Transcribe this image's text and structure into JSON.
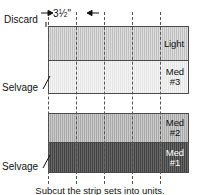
{
  "diagram": {
    "caption": "Subcut the strip sets into units.",
    "dimension": {
      "whole": "3",
      "numerator": "1",
      "denominator": "2",
      "unit": "\"",
      "full_label": "3 1/2\"",
      "arrow_left": "arrow-right-glyph",
      "arrow_right": "arrow-left-glyph"
    },
    "callouts": [
      {
        "id": "discard",
        "label": "Discard"
      },
      {
        "id": "selvage1",
        "label": "Selvage"
      },
      {
        "id": "selvage2",
        "label": "Selvage"
      }
    ],
    "groups": [
      {
        "id": "group-top",
        "strips": [
          {
            "id": "strip-light",
            "label": "Light",
            "shade": "fabric-light",
            "color": "#c9c9c9",
            "height": 33,
            "on_dark": false
          },
          {
            "id": "strip-med3",
            "label": "Med\n#3",
            "shade": "fabric-pale",
            "color": "#ececec",
            "height": 33,
            "on_dark": false
          }
        ]
      },
      {
        "id": "group-bottom",
        "strips": [
          {
            "id": "strip-med2",
            "label": "Med\n#2",
            "shade": "fabric-med",
            "color": "#b4b4b4",
            "height": 28,
            "on_dark": false
          },
          {
            "id": "strip-med1",
            "label": "Med\n#1",
            "shade": "fabric-dark",
            "color": "#4f4f4f",
            "height": 30,
            "on_dark": true
          }
        ]
      }
    ],
    "cutlines": [
      {
        "id": "cutline-1",
        "x": 48
      },
      {
        "id": "cutline-2",
        "x": 76
      },
      {
        "id": "cutline-3",
        "x": 104
      },
      {
        "id": "cutline-4",
        "x": 132
      },
      {
        "id": "cutline-5",
        "x": 160
      }
    ],
    "colors": {
      "outline": "#4a4a4a",
      "dash": "#555555",
      "text": "#111111",
      "background": "#ffffff"
    }
  }
}
